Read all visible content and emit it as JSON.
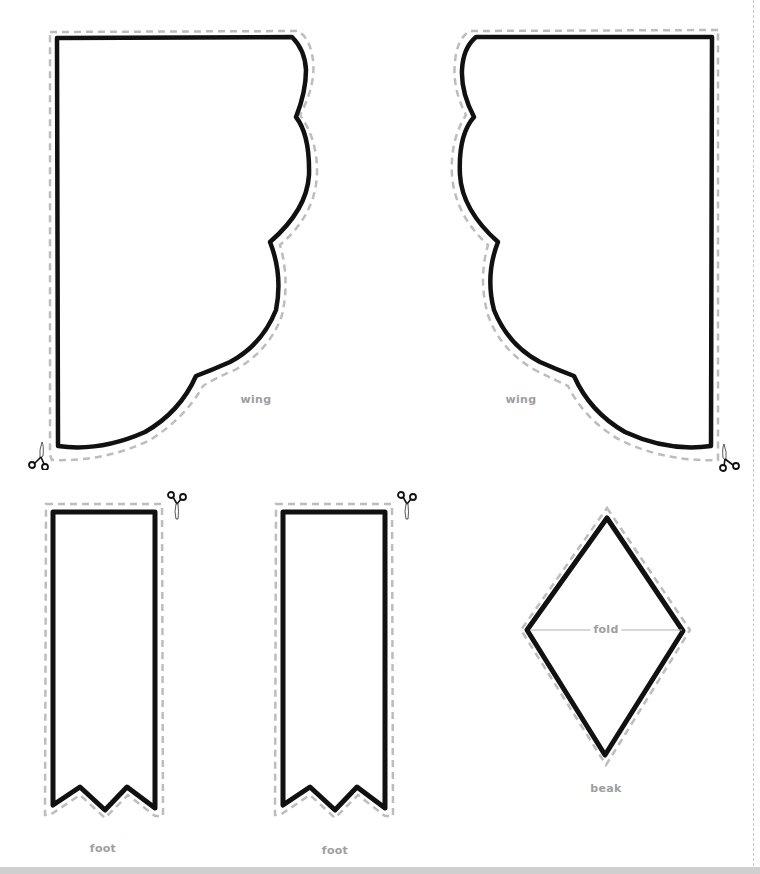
{
  "page": {
    "header_fragment": "",
    "background": "#ffffff"
  },
  "pieces": {
    "wing_left": {
      "label": "wing"
    },
    "wing_right": {
      "label": "wing"
    },
    "foot_left": {
      "label": "foot"
    },
    "foot_right": {
      "label": "foot"
    },
    "beak": {
      "label": "beak",
      "fold_label": "fold"
    }
  },
  "colors": {
    "outline": "#111111",
    "cut_line": "#bdbdbd",
    "label": "#9e9e9e",
    "bottom_band": "#cfcfcf"
  },
  "icons": {
    "scissors": "scissors-icon"
  }
}
